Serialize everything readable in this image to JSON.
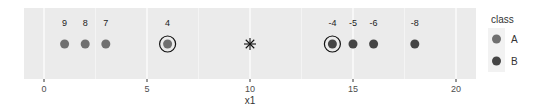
{
  "chart_data": {
    "type": "scatter",
    "title": "",
    "xlabel": "x1",
    "ylabel": "",
    "xlim": [
      -1,
      21
    ],
    "x_ticks": [
      0,
      5,
      10,
      15,
      20
    ],
    "x_tick_labels": [
      "0",
      "5",
      "10",
      "15",
      "20"
    ],
    "grid": true,
    "legend_position": "right",
    "legend": {
      "title": "class",
      "entries": [
        {
          "label": "A",
          "color": "#707070"
        },
        {
          "label": "B",
          "color": "#454545"
        }
      ]
    },
    "points": [
      {
        "x": 1,
        "label": "9",
        "class": "A",
        "circled": false
      },
      {
        "x": 2,
        "label": "8",
        "class": "A",
        "circled": false
      },
      {
        "x": 3,
        "label": "7",
        "class": "A",
        "circled": false
      },
      {
        "x": 6,
        "label": "4",
        "class": "A",
        "circled": true
      },
      {
        "x": 14,
        "label": "-4",
        "class": "B",
        "circled": true
      },
      {
        "x": 15,
        "label": "-5",
        "class": "B",
        "circled": false
      },
      {
        "x": 16,
        "label": "-6",
        "class": "B",
        "circled": false
      },
      {
        "x": 18,
        "label": "-8",
        "class": "B",
        "circled": false
      }
    ],
    "query_point": {
      "x": 10,
      "marker": "asterisk"
    }
  },
  "colors": {
    "panel_bg": "#ebebeb",
    "grid": "#ffffff",
    "class_A": "#707070",
    "class_B": "#454545"
  }
}
